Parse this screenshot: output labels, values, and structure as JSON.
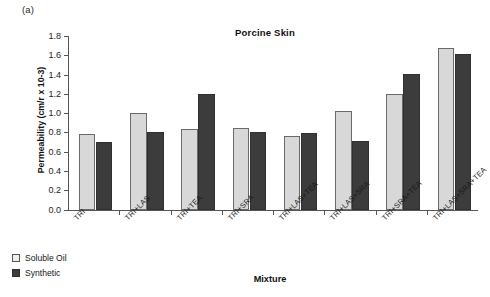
{
  "figure": {
    "panel_label": "(a)"
  },
  "chart_data": {
    "type": "bar",
    "title": "Porcine Skin",
    "xlabel": "Mixture",
    "ylabel": "Permeability (cm/r x 10-3)",
    "ylim": [
      0.0,
      1.8
    ],
    "ytick_labels": [
      "1.8",
      "1.6",
      "1.4",
      "1.2",
      "1.0",
      "0.8",
      "0.6",
      "0.4",
      "0.2",
      "0.0"
    ],
    "ytick_values": [
      1.8,
      1.6,
      1.4,
      1.2,
      1.0,
      0.8,
      0.6,
      0.4,
      0.2,
      0.0
    ],
    "grid": false,
    "legend_position": "below-left",
    "categories": [
      "TRI",
      "TRI+LAS",
      "TRI+TEA",
      "TRI+SRA",
      "TRI+LAS+TEA",
      "TRI+LAS+SRA",
      "TRI+SRA+TEA",
      "TRI+LAS+SRA+TEA"
    ],
    "series": [
      {
        "name": "Soluble Oil",
        "color": "#d8d8d8",
        "values": [
          0.78,
          1.0,
          0.84,
          0.85,
          0.76,
          1.02,
          1.2,
          1.68
        ]
      },
      {
        "name": "Synthetic",
        "color": "#3c3c3c",
        "values": [
          0.7,
          0.8,
          1.2,
          0.8,
          0.79,
          0.71,
          1.41,
          1.61
        ]
      }
    ]
  }
}
